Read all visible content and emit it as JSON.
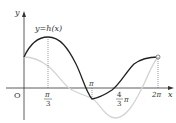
{
  "figure": {
    "function_label": "y=h(x)",
    "axis_x_label": "x",
    "axis_y_label": "y",
    "origin_label": "O",
    "ticks": {
      "pi_over_3": {
        "num": "π",
        "den": "3"
      },
      "pi": "π",
      "four_thirds_pi": {
        "num": "4",
        "den": "3",
        "suffix": "π"
      },
      "two_pi": "2π"
    },
    "colors": {
      "main_curve": "#222222",
      "secondary_curve": "#d0d0d0",
      "axes": "#333333"
    }
  }
}
